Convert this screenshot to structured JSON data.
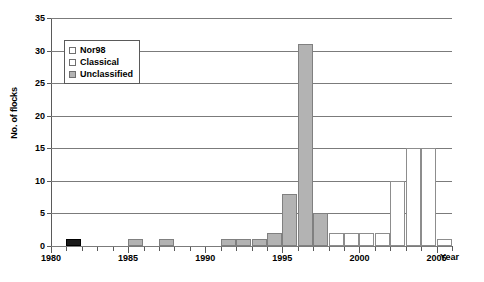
{
  "chart_data": {
    "type": "bar",
    "title": "",
    "xlabel": "Year",
    "ylabel": "No. of flocks",
    "ylim": [
      0,
      35
    ],
    "ytick_step": 5,
    "yticks": [
      0,
      5,
      10,
      15,
      20,
      25,
      30,
      35
    ],
    "xlim": [
      1980,
      2006
    ],
    "xticks_major": [
      1980,
      1985,
      1990,
      1995,
      2000,
      2005
    ],
    "xtick_labels": [
      "1980",
      "1985",
      "1990",
      "1995",
      "2000",
      "2005"
    ],
    "grid": "horizontal",
    "stacked": true,
    "legend_position": "upper-left-inside",
    "categories": [
      1980,
      1981,
      1982,
      1983,
      1984,
      1985,
      1986,
      1987,
      1988,
      1989,
      1990,
      1991,
      1992,
      1993,
      1994,
      1995,
      1996,
      1997,
      1998,
      1999,
      2000,
      2001,
      2002,
      2003,
      2004,
      2005
    ],
    "series": [
      {
        "name": "Nor98",
        "color": "#ffffff",
        "values": [
          0,
          0,
          0,
          0,
          0,
          0,
          0,
          0,
          0,
          0,
          0,
          0,
          0,
          0,
          0,
          0,
          0,
          0,
          2,
          2,
          2,
          2,
          10,
          15,
          15,
          1
        ]
      },
      {
        "name": "Classical",
        "color": "#1a1a1a",
        "values": [
          0,
          1,
          0,
          0,
          0,
          0,
          0,
          0,
          0,
          0,
          0,
          0,
          0,
          0,
          0,
          0,
          0,
          0,
          0,
          0,
          0,
          0,
          0,
          0,
          0,
          0
        ]
      },
      {
        "name": "Unclassified",
        "color": "#b3b3b3",
        "values": [
          0,
          0,
          0,
          0,
          0,
          1,
          0,
          1,
          0,
          0,
          0,
          1,
          1,
          1,
          2,
          8,
          31,
          5,
          0,
          0,
          0,
          0,
          0,
          0,
          0,
          0
        ]
      }
    ],
    "legend": [
      {
        "label": "Nor98",
        "swatch": "nor98"
      },
      {
        "label": "Classical",
        "swatch": "classical"
      },
      {
        "label": "Unclassified",
        "swatch": "unclassified"
      }
    ]
  }
}
